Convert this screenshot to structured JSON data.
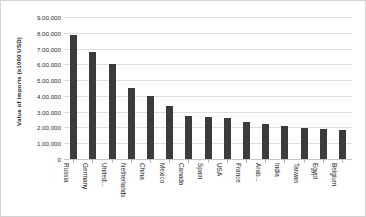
{
  "chart_data": {
    "type": "bar",
    "title": "",
    "subtitle": "",
    "xlabel": "",
    "ylabel": "Value of imports (x1000 USD)",
    "ylim": [
      0,
      900000
    ],
    "grid": true,
    "legend": false,
    "legend_position": "none",
    "orientation": "vertical",
    "bar_color": "#3b3b3b",
    "gridline_color": "#dfdfdf",
    "y_tick_values": [
      0,
      100000,
      200000,
      300000,
      400000,
      500000,
      600000,
      700000,
      800000,
      900000
    ],
    "y_tick_labels": [
      "0",
      "1,00,000",
      "2,00,000",
      "3,00,000",
      "4,00,000",
      "5,00,000",
      "6,00,000",
      "7,00,000",
      "8,00,000",
      "9,00,000"
    ],
    "categories": [
      "Russia",
      "Germany",
      "United...",
      "Netherlands",
      "China",
      "Mexico",
      "Canada",
      "Spain",
      "USA",
      "France",
      "Arab...",
      "India",
      "Taiwan",
      "Egypt",
      "Belgium"
    ],
    "values": [
      785000,
      681000,
      605000,
      448000,
      401000,
      338000,
      274000,
      268000,
      258000,
      234000,
      225000,
      208000,
      198000,
      190000,
      183000
    ],
    "annotations": []
  }
}
